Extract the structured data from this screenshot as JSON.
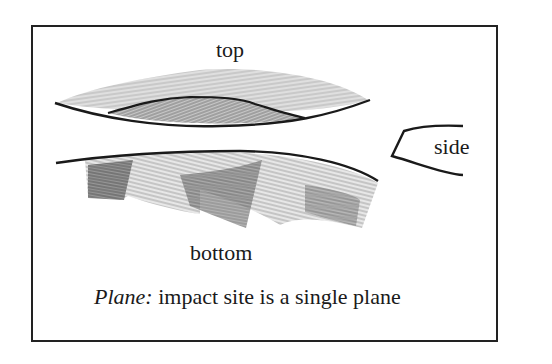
{
  "figure": {
    "labels": {
      "top": "top",
      "side": "side",
      "bottom": "bottom"
    },
    "caption": {
      "term": "Plane:",
      "description": " impact site is a single plane"
    },
    "colors": {
      "frame": "#222222",
      "outline": "#1a1a1a",
      "shading_light": "#b8b8b8",
      "shading_dark": "#6e6e6e",
      "background": "#ffffff"
    }
  }
}
